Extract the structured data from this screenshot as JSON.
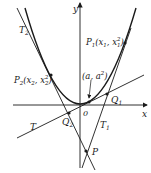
{
  "figure": {
    "axes": {
      "x_label": "x",
      "y_label": "y",
      "origin_label": "0"
    },
    "curve": {
      "name": "parabola",
      "equation": "y = x^2"
    },
    "points": {
      "P1": {
        "label": "P",
        "sub": "1",
        "coords": "(x",
        "coords_sub": "1",
        "coords_mid": ", x",
        "coords_sup": "2",
        "coords_sub2": "1",
        "coords_end": ")"
      },
      "P2": {
        "label": "P",
        "sub": "2",
        "coords": "(x",
        "coords_sub": "2",
        "coords_mid": ", x",
        "coords_sup": "2",
        "coords_sub2": "2",
        "coords_end": ")"
      },
      "A": {
        "label": "(a, a",
        "sup": "2",
        "end": ")"
      },
      "Q1": {
        "label": "Q",
        "sub": "1"
      },
      "Q2": {
        "label": "Q",
        "sub": "2"
      },
      "P": {
        "label": "P"
      }
    },
    "lines": {
      "T": {
        "label": "T"
      },
      "T1": {
        "label": "T",
        "sub": "1"
      },
      "T2": {
        "label": "T",
        "sub": "2"
      }
    }
  }
}
